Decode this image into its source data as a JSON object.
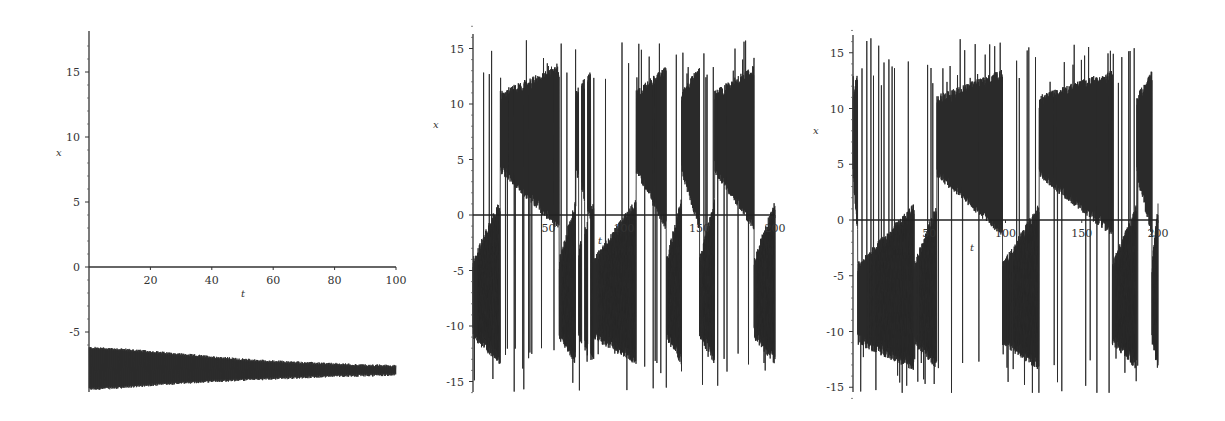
{
  "chart_data": [
    {
      "type": "line",
      "panel": "left",
      "title": "",
      "xlabel": "t",
      "ylabel": "x",
      "xlim": [
        0,
        100
      ],
      "ylim": [
        -9.5,
        18
      ],
      "xticks": [
        20,
        40,
        60,
        80,
        100
      ],
      "yticks": [
        -5,
        0,
        5,
        10,
        15
      ],
      "grid": false,
      "legend": null,
      "color": "#2a2a2a",
      "description": "Rapid oscillation confined to a narrow band that contracts over time: envelope from [-9.4, -6.2] at t=0 to [-8.3, -7.6] at t=100 (converging to stable equilibrium near x≈-8).",
      "envelope": {
        "t": [
          0,
          10,
          20,
          30,
          40,
          50,
          60,
          70,
          80,
          90,
          100
        ],
        "upper": [
          -6.2,
          -6.3,
          -6.5,
          -6.7,
          -6.9,
          -7.1,
          -7.25,
          -7.35,
          -7.45,
          -7.55,
          -7.6
        ],
        "lower": [
          -9.4,
          -9.3,
          -9.1,
          -8.95,
          -8.8,
          -8.7,
          -8.6,
          -8.5,
          -8.4,
          -8.35,
          -8.3
        ]
      }
    },
    {
      "type": "line",
      "panel": "middle",
      "title": "",
      "xlabel": "t",
      "ylabel": "x",
      "xlim": [
        0,
        200
      ],
      "ylim": [
        -16,
        16
      ],
      "xticks": [
        50,
        100,
        150,
        200
      ],
      "yticks": [
        -15,
        -10,
        -5,
        0,
        5,
        10,
        15
      ],
      "grid": false,
      "legend": null,
      "color": "#2a2a2a",
      "description": "Chaotic double-scroll style trajectory switching irregularly between a positive lobe (x≈2..13) and a negative lobe (x≈-13..-2), with spikes reaching ±16.",
      "lobe_segments": [
        {
          "t0": 0,
          "t1": 18,
          "lobe": "negative"
        },
        {
          "t0": 18,
          "t1": 57,
          "lobe": "positive"
        },
        {
          "t0": 57,
          "t1": 68,
          "lobe": "negative"
        },
        {
          "t0": 68,
          "t1": 80,
          "lobe": "mixed"
        },
        {
          "t0": 80,
          "t1": 108,
          "lobe": "negative"
        },
        {
          "t0": 108,
          "t1": 128,
          "lobe": "positive"
        },
        {
          "t0": 128,
          "t1": 138,
          "lobe": "negative"
        },
        {
          "t0": 138,
          "t1": 150,
          "lobe": "positive"
        },
        {
          "t0": 150,
          "t1": 160,
          "lobe": "negative"
        },
        {
          "t0": 160,
          "t1": 186,
          "lobe": "positive"
        },
        {
          "t0": 186,
          "t1": 200,
          "lobe": "negative"
        }
      ],
      "peaks": {
        "max": 16,
        "min": -16
      }
    },
    {
      "type": "line",
      "panel": "right",
      "title": "",
      "xlabel": "t",
      "ylabel": "x",
      "xlim": [
        0,
        200
      ],
      "ylim": [
        -15.5,
        16
      ],
      "xticks": [
        50,
        100,
        150,
        200
      ],
      "yticks": [
        -15,
        -10,
        -5,
        0,
        5,
        10,
        15
      ],
      "grid": false,
      "legend": null,
      "color": "#2a2a2a",
      "description": "Chaotic trajectory for a slightly perturbed initial condition; switches irregularly between positive and negative lobes, with spikes up to ±16.",
      "lobe_segments": [
        {
          "t0": 0,
          "t1": 3,
          "lobe": "positive"
        },
        {
          "t0": 3,
          "t1": 40,
          "lobe": "negative"
        },
        {
          "t0": 40,
          "t1": 55,
          "lobe": "negative"
        },
        {
          "t0": 55,
          "t1": 98,
          "lobe": "positive"
        },
        {
          "t0": 98,
          "t1": 122,
          "lobe": "negative"
        },
        {
          "t0": 122,
          "t1": 170,
          "lobe": "positive"
        },
        {
          "t0": 170,
          "t1": 186,
          "lobe": "negative"
        },
        {
          "t0": 186,
          "t1": 196,
          "lobe": "positive"
        },
        {
          "t0": 196,
          "t1": 200,
          "lobe": "negative"
        }
      ],
      "peaks": {
        "max": 16.3,
        "min": -15.5
      }
    }
  ],
  "panels": {
    "left": {
      "xlabel": "t",
      "ylabel": "x",
      "xticks": [
        "20",
        "40",
        "60",
        "80",
        "100"
      ],
      "yticks": [
        "-5",
        "0",
        "5",
        "10",
        "15"
      ]
    },
    "middle": {
      "xlabel": "t",
      "ylabel": "x",
      "xticks": [
        "50",
        "100",
        "150",
        "200"
      ],
      "yticks": [
        "-15",
        "-10",
        "-5",
        "0",
        "5",
        "10",
        "15"
      ]
    },
    "right": {
      "xlabel": "t",
      "ylabel": "x",
      "xticks": [
        "50",
        "100",
        "150",
        "200"
      ],
      "yticks": [
        "-15",
        "-10",
        "-5",
        "0",
        "5",
        "10",
        "15"
      ]
    }
  }
}
